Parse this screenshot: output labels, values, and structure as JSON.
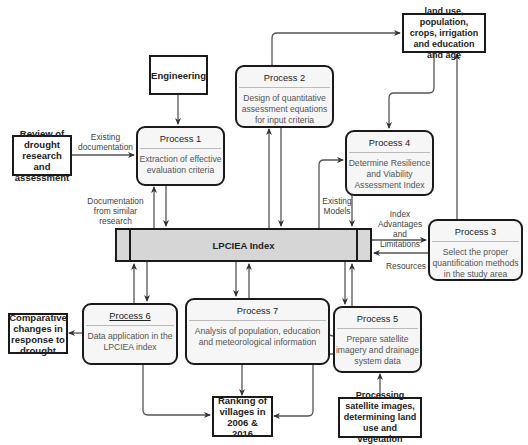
{
  "diagram": {
    "external_entities": {
      "engineering": "Engineering",
      "review": "Review of drought research and assessment",
      "land_use": "land use, population, crops, irrigation and education and age",
      "comparative": "Comparative changes in response to drought",
      "ranking": "Ranking of villages in 2006 & 2016",
      "processing_satellite": "Processing satellite images, determining land use and vegetation"
    },
    "data_store": {
      "label": "LPCIEA Index"
    },
    "processes": [
      {
        "id": "p1",
        "title": "Process 1",
        "body": "Extraction of effective evaluation criteria"
      },
      {
        "id": "p2",
        "title": "Process 2",
        "body": "Design of quantitative assessment equations for input criteria"
      },
      {
        "id": "p3",
        "title": "Process 3",
        "body": "Select the proper quantification methods in the study area"
      },
      {
        "id": "p4",
        "title": "Process 4",
        "body": "Determine Resilience and Viability Assessment Index"
      },
      {
        "id": "p5",
        "title": "Process 5",
        "body": "Prepare satellite imagery and drainage system data"
      },
      {
        "id": "p6",
        "title": "Process 6",
        "body": "Data application in the LPCIEA index"
      },
      {
        "id": "p7",
        "title": "Process 7",
        "body": "Analysis of population, education and meteorological information"
      }
    ],
    "flow_labels": {
      "existing_documentation": "Existing documentation",
      "documentation_similar": "Documentation from similar research",
      "existing_models": "Existing Models",
      "index_adv": "Index Advantages and Limitations",
      "resources": "Resources"
    }
  }
}
